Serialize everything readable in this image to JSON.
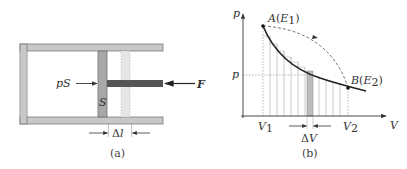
{
  "figure_a": {
    "caption": "(a)",
    "labels": {
      "pressure_force": "pS",
      "piston_area": "S",
      "applied_force": "F",
      "displacement_delta": "Δ",
      "displacement_var": "l"
    },
    "colors": {
      "cylinder_wall": "#c8c8c8",
      "cylinder_edge": "#7a7a7a",
      "piston": "#a8a8a8",
      "rod": "#555555",
      "ghost_piston": "#e4e4e4"
    }
  },
  "figure_b": {
    "caption": "(b)",
    "axes": {
      "y_label": "p",
      "x_label": "V"
    },
    "points": {
      "A_name": "A",
      "A_state": "E",
      "A_sub": "1",
      "B_name": "B",
      "B_state": "E",
      "B_sub": "2"
    },
    "ticks": {
      "p_tick": "p",
      "V1": "V",
      "V1_sub": "1",
      "V2": "V",
      "V2_sub": "2",
      "dV_delta": "Δ",
      "dV_var": "V"
    },
    "colors": {
      "curve": "#222222",
      "dashed_path": "#555555",
      "strip_lines": "#9a9a9a",
      "highlight_strip": "#bdbdbd"
    }
  }
}
